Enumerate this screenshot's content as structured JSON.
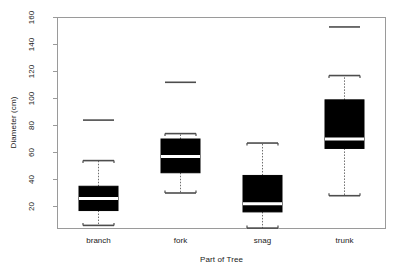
{
  "chart_data": {
    "type": "box",
    "title": "",
    "xlabel": "Part of Tree",
    "ylabel": "Diameter (cm)",
    "ylim": [
      0,
      165
    ],
    "yticks": [
      20,
      40,
      60,
      80,
      100,
      120,
      140,
      160
    ],
    "ytick_labels": [
      "20",
      "40",
      "60",
      "80",
      "100",
      "120",
      "140",
      "160"
    ],
    "categories": [
      "branch",
      "fork",
      "snag",
      "trunk"
    ],
    "grid": false,
    "legend": null,
    "boxes": [
      {
        "name": "branch",
        "whisker_low": 6,
        "q1": 17,
        "median": 26,
        "q3": 35,
        "whisker_high": 54,
        "outliers": [
          84
        ]
      },
      {
        "name": "fork",
        "whisker_low": 30,
        "q1": 45,
        "median": 57,
        "q3": 70,
        "whisker_high": 74,
        "outliers": [
          112
        ]
      },
      {
        "name": "snag",
        "whisker_low": 4,
        "q1": 16,
        "median": 22,
        "q3": 43,
        "whisker_high": 67,
        "outliers": []
      },
      {
        "name": "trunk",
        "whisker_low": 28,
        "q1": 63,
        "median": 70,
        "q3": 99,
        "whisker_high": 117,
        "outliers": [
          153
        ]
      }
    ],
    "colors": {
      "box_fill": "#000000",
      "box_edge": "#000000",
      "median": "#ffffff",
      "whisker": "#6e6e6e",
      "cap": "#4d4d4d",
      "outlier": "#4d4d4d",
      "frame": "#9a9a9a",
      "text": "#1a1a1a"
    }
  },
  "axes": {
    "ylabel": "Diameter (cm)",
    "xlabel": "Part of Tree",
    "ytick_labels": [
      "20",
      "40",
      "60",
      "80",
      "100",
      "120",
      "140",
      "160"
    ],
    "xtick_labels": [
      "branch",
      "fork",
      "snag",
      "trunk"
    ]
  }
}
